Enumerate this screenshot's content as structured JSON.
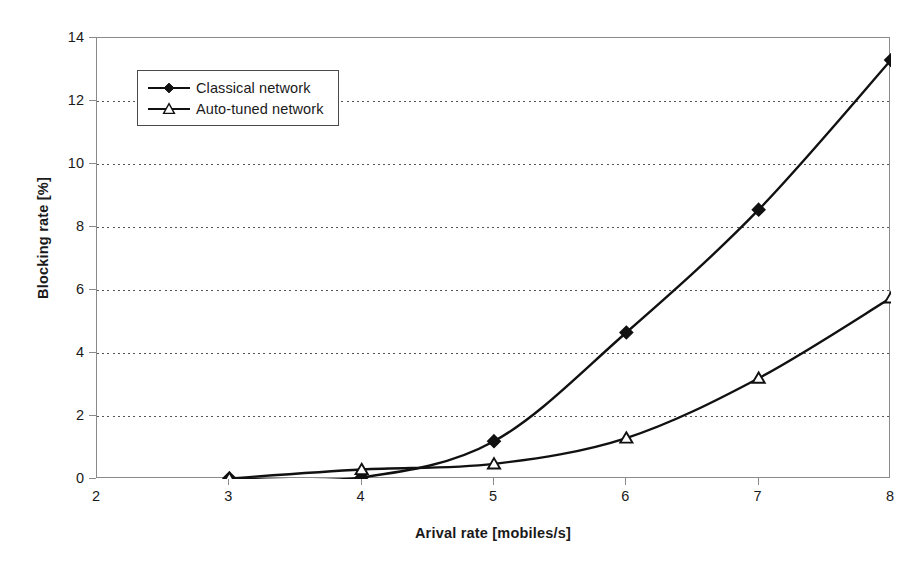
{
  "chart_data": {
    "type": "line",
    "title": "",
    "xlabel": "Arival rate [mobiles/s]",
    "ylabel": "Blocking rate [%]",
    "x": [
      3,
      4,
      5,
      6,
      7,
      8
    ],
    "xlim": [
      2,
      8
    ],
    "ylim": [
      0,
      14
    ],
    "xticks": [
      "2",
      "3",
      "4",
      "5",
      "6",
      "7",
      "8"
    ],
    "yticks": [
      "0",
      "2",
      "4",
      "6",
      "8",
      "10",
      "12",
      "14"
    ],
    "grid": "horizontal-dotted",
    "legend_position": "upper-left-inside",
    "series": [
      {
        "name": "Classical network",
        "marker": "filled-diamond",
        "values": [
          0.02,
          0.05,
          1.2,
          4.65,
          8.55,
          13.3
        ]
      },
      {
        "name": "Auto-tuned network",
        "marker": "open-triangle",
        "values": [
          0.02,
          0.3,
          0.48,
          1.3,
          3.2,
          5.75
        ]
      }
    ],
    "colors": {
      "line": "#111111",
      "marker_fill_classical": "#111111",
      "marker_fill_autotuned": "#ffffff",
      "axis": "#8a8a8a",
      "grid": "#555555",
      "background": "#ffffff"
    }
  },
  "legend": {
    "items": [
      {
        "label": "Classical network"
      },
      {
        "label": "Auto-tuned network"
      }
    ]
  },
  "axes": {
    "y_title": "Blocking rate [%]",
    "x_title": "Arival rate [mobiles/s]"
  }
}
